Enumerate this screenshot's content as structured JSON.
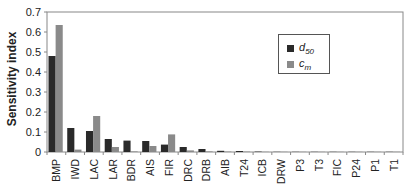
{
  "chart_data": {
    "type": "bar",
    "title": "",
    "xlabel": "",
    "ylabel": "Sensitivity index",
    "ylim": [
      0,
      0.7
    ],
    "yticks": [
      0,
      0.1,
      0.2,
      0.3,
      0.4,
      0.5,
      0.6,
      0.7
    ],
    "grid": false,
    "legend_position": "upper right (inside)",
    "categories": [
      "BMP",
      "IWD",
      "LAC",
      "LAR",
      "BDR",
      "AIS",
      "FIR",
      "DRC",
      "DRB",
      "AIB",
      "T24",
      "ICB",
      "DRW",
      "P3",
      "T3",
      "FIC",
      "P24",
      "P1",
      "T1"
    ],
    "series": [
      {
        "name": "d50",
        "label_main": "d",
        "label_sub": "50",
        "color": "#2a2a2a",
        "values": [
          0.48,
          0.12,
          0.105,
          0.065,
          0.057,
          0.055,
          0.037,
          0.025,
          0.015,
          0.006,
          0.005,
          0.002,
          0.001,
          0.001,
          0.001,
          0.001,
          0.001,
          0.001,
          0.001
        ]
      },
      {
        "name": "cm",
        "label_main": "c",
        "label_sub": "m",
        "color": "#8a8a8a",
        "values": [
          0.635,
          0.012,
          0.18,
          0.025,
          0.003,
          0.03,
          0.088,
          0.008,
          0.003,
          0.002,
          0.002,
          0.001,
          0.001,
          0.001,
          0.001,
          0.001,
          0.001,
          0.001,
          0.001
        ]
      }
    ]
  }
}
